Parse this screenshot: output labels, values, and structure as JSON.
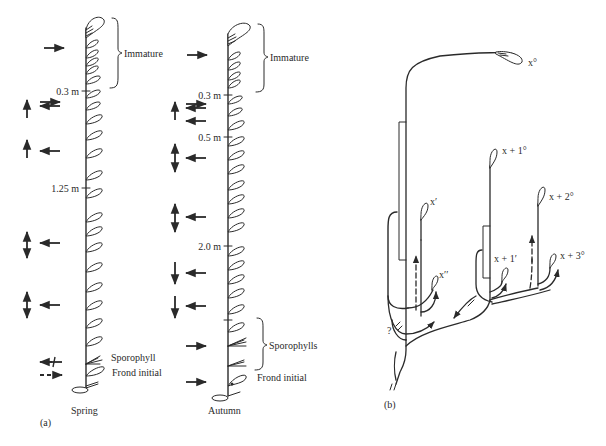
{
  "panel_a": {
    "label": "(a)",
    "spring": {
      "caption": "Spring",
      "immature_label": "Immature",
      "scale_marks": [
        "0.3 m",
        "1.25 m"
      ],
      "sporophyll_label": "Sporophyll",
      "frond_initial_label": "Frond initial"
    },
    "autumn": {
      "caption": "Autumn",
      "immature_label": "Immature",
      "scale_marks": [
        "0.3 m",
        "0.5 m",
        "2.0 m"
      ],
      "sporophylls_label": "Sporophylls",
      "frond_initial_label": "Frond initial"
    }
  },
  "panel_b": {
    "label": "(b)",
    "nodes": [
      "x°",
      "x + 1°",
      "x′",
      "x + 2°",
      "x + 1′",
      "x + 3°",
      "x′′"
    ],
    "question_mark": "?"
  },
  "colors": {
    "ink": "#2a2a2a",
    "background": "#ffffff"
  }
}
